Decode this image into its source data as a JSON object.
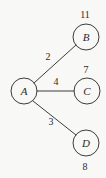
{
  "diagram": {
    "type": "weighted-graph",
    "background_color": "#f8f8f6",
    "stroke_color": "#3c3c3c",
    "text_color": "#2b2b2b",
    "nodes": [
      {
        "id": "A",
        "label": "A",
        "value": "",
        "cx": 24,
        "cy": 91,
        "r": 13,
        "value_x": 0,
        "value_y": 0,
        "value_pos": "none"
      },
      {
        "id": "B",
        "label": "B",
        "value": "11",
        "cx": 86,
        "cy": 37,
        "r": 13,
        "value_x": 85,
        "value_y": 14,
        "value_pos": "above"
      },
      {
        "id": "C",
        "label": "C",
        "value": "7",
        "cx": 87,
        "cy": 91,
        "r": 13,
        "value_x": 86,
        "value_y": 69,
        "value_pos": "above"
      },
      {
        "id": "D",
        "label": "D",
        "value": "8",
        "cx": 86,
        "cy": 143,
        "r": 13,
        "value_x": 85,
        "value_y": 166,
        "value_pos": "below"
      }
    ],
    "edges": [
      {
        "from": "A",
        "to": "B",
        "weight": "2",
        "x1": 34,
        "y1": 83,
        "x2": 76,
        "y2": 45,
        "label_x": 48,
        "label_y": 56
      },
      {
        "from": "A",
        "to": "C",
        "weight": "4",
        "x1": 37,
        "y1": 91,
        "x2": 74,
        "y2": 91,
        "label_x": 56,
        "label_y": 81
      },
      {
        "from": "A",
        "to": "D",
        "weight": "3",
        "x1": 33,
        "y1": 101,
        "x2": 76,
        "y2": 135,
        "label_x": 51,
        "label_y": 121
      }
    ]
  }
}
